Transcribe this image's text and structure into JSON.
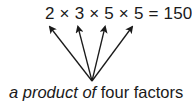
{
  "equation": {
    "text": "2 × 3 × 5 × 5 = 150",
    "factors": [
      "2",
      "3",
      "5",
      "5"
    ],
    "result": "150"
  },
  "caption": {
    "italic_part": "a product of",
    "plain_part": " four factors"
  },
  "arrows": {
    "origin": [
      92,
      81
    ],
    "targets": [
      [
        50,
        27
      ],
      [
        78,
        27
      ],
      [
        105,
        27
      ],
      [
        132,
        27
      ]
    ],
    "color": "#1a1a1a"
  }
}
